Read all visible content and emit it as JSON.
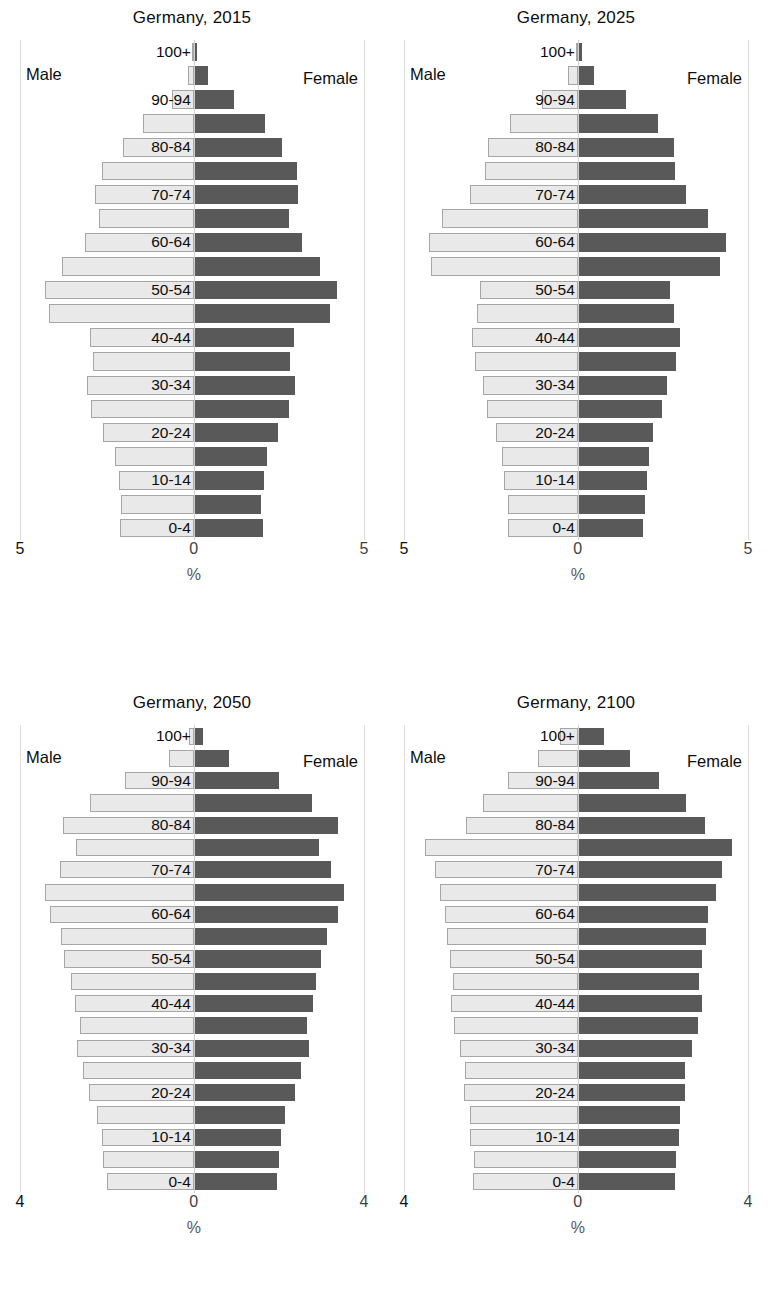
{
  "figure": {
    "axis_unit_label": "%",
    "male_legend": "Male",
    "female_legend": "Female",
    "colors": {
      "male_bar_fill": "#e9e9e9",
      "male_bar_border": "#a6a6a6",
      "female_bar_fill": "#595959",
      "gridline": "#dcdcdc",
      "text": "#0d0d0d"
    },
    "age_groups": [
      "0-4",
      "5-9",
      "10-14",
      "15-19",
      "20-24",
      "25-29",
      "30-34",
      "35-39",
      "40-44",
      "45-49",
      "50-54",
      "55-59",
      "60-64",
      "65-69",
      "70-74",
      "75-79",
      "80-84",
      "85-89",
      "90-94",
      "95-99",
      "100+"
    ],
    "visible_age_labels": [
      "0-4",
      "10-14",
      "20-24",
      "30-34",
      "40-44",
      "50-54",
      "60-64",
      "70-74",
      "80-84",
      "90-94",
      "100+"
    ]
  },
  "chart_data": [
    {
      "type": "bar",
      "subtype": "population-pyramid",
      "title": "Germany, 2015",
      "xlabel": "%",
      "ylabel": "",
      "xlim": [
        -5,
        5
      ],
      "xticks": [
        "5",
        "0",
        "5"
      ],
      "grid": false,
      "legend": [
        "Male",
        "Female"
      ],
      "legend_position": "inside-top-left / inside-top-right",
      "categories": [
        "0-4",
        "5-9",
        "10-14",
        "15-19",
        "20-24",
        "25-29",
        "30-34",
        "35-39",
        "40-44",
        "45-49",
        "50-54",
        "55-59",
        "60-64",
        "65-69",
        "70-74",
        "75-79",
        "80-84",
        "85-89",
        "90-94",
        "95-99",
        "100+"
      ],
      "series": [
        {
          "name": "Male",
          "values": [
            2.12,
            2.08,
            2.15,
            2.28,
            2.62,
            2.96,
            3.08,
            2.9,
            3.0,
            4.17,
            4.28,
            3.78,
            3.12,
            2.72,
            2.85,
            2.65,
            2.05,
            1.45,
            0.62,
            0.17,
            0.03
          ]
        },
        {
          "name": "Female",
          "values": [
            2.02,
            1.98,
            2.05,
            2.16,
            2.48,
            2.8,
            2.96,
            2.82,
            2.95,
            4.0,
            4.2,
            3.72,
            3.18,
            2.8,
            3.05,
            3.02,
            2.6,
            2.08,
            1.18,
            0.42,
            0.08
          ]
        }
      ]
    },
    {
      "type": "bar",
      "subtype": "population-pyramid",
      "title": "Germany, 2025",
      "xlabel": "%",
      "ylabel": "",
      "xlim": [
        -5,
        5
      ],
      "xticks": [
        "5",
        "0",
        "5"
      ],
      "grid": false,
      "legend": [
        "Male",
        "Female"
      ],
      "legend_position": "inside-top-left / inside-top-right",
      "categories": [
        "0-4",
        "5-9",
        "10-14",
        "15-19",
        "20-24",
        "25-29",
        "30-34",
        "35-39",
        "40-44",
        "45-49",
        "50-54",
        "55-59",
        "60-64",
        "65-69",
        "70-74",
        "75-79",
        "80-84",
        "85-89",
        "90-94",
        "95-99",
        "100+"
      ],
      "series": [
        {
          "name": "Male",
          "values": [
            2.0,
            2.02,
            2.12,
            2.18,
            2.35,
            2.6,
            2.72,
            2.95,
            3.05,
            2.9,
            2.8,
            4.22,
            4.28,
            3.9,
            3.1,
            2.68,
            2.58,
            1.95,
            1.02,
            0.28,
            0.06
          ]
        },
        {
          "name": "Female",
          "values": [
            1.92,
            1.96,
            2.02,
            2.08,
            2.22,
            2.48,
            2.62,
            2.88,
            3.0,
            2.82,
            2.72,
            4.18,
            4.35,
            3.82,
            3.18,
            2.85,
            2.82,
            2.35,
            1.42,
            0.48,
            0.12
          ]
        }
      ]
    },
    {
      "type": "bar",
      "subtype": "population-pyramid",
      "title": "Germany, 2050",
      "xlabel": "%",
      "ylabel": "",
      "xlim": [
        -4,
        4
      ],
      "xticks": [
        "4",
        "0",
        "4"
      ],
      "grid": false,
      "legend": [
        "Male",
        "Female"
      ],
      "legend_position": "inside-top-left / inside-top-right",
      "categories": [
        "0-4",
        "5-9",
        "10-14",
        "15-19",
        "20-24",
        "25-29",
        "30-34",
        "35-39",
        "40-44",
        "45-49",
        "50-54",
        "55-59",
        "60-64",
        "65-69",
        "70-74",
        "75-79",
        "80-84",
        "85-89",
        "90-94",
        "95-99",
        "100+"
      ],
      "series": [
        {
          "name": "Male",
          "values": [
            2.0,
            2.08,
            2.12,
            2.22,
            2.42,
            2.56,
            2.68,
            2.62,
            2.74,
            2.82,
            2.98,
            3.05,
            3.3,
            3.42,
            3.08,
            2.72,
            3.02,
            2.4,
            1.58,
            0.58,
            0.1
          ]
        },
        {
          "name": "Female",
          "values": [
            1.96,
            2.0,
            2.06,
            2.15,
            2.38,
            2.52,
            2.7,
            2.66,
            2.8,
            2.88,
            3.0,
            3.12,
            3.4,
            3.52,
            3.22,
            2.95,
            3.38,
            2.78,
            2.0,
            0.82,
            0.22
          ]
        }
      ]
    },
    {
      "type": "bar",
      "subtype": "population-pyramid",
      "title": "Germany, 2100",
      "xlabel": "%",
      "ylabel": "",
      "xlim": [
        -4,
        4
      ],
      "xticks": [
        "4",
        "0",
        "4"
      ],
      "grid": false,
      "legend": [
        "Male",
        "Female"
      ],
      "legend_position": "inside-top-left / inside-top-right",
      "categories": [
        "0-4",
        "5-9",
        "10-14",
        "15-19",
        "20-24",
        "25-29",
        "30-34",
        "35-39",
        "40-44",
        "45-49",
        "50-54",
        "55-59",
        "60-64",
        "65-69",
        "70-74",
        "75-79",
        "80-84",
        "85-89",
        "90-94",
        "95-99",
        "100+"
      ],
      "series": [
        {
          "name": "Male",
          "values": [
            2.42,
            2.38,
            2.48,
            2.48,
            2.62,
            2.6,
            2.72,
            2.85,
            2.92,
            2.88,
            2.95,
            3.0,
            3.05,
            3.18,
            3.28,
            3.52,
            2.58,
            2.18,
            1.6,
            0.92,
            0.42
          ]
        },
        {
          "name": "Female",
          "values": [
            2.28,
            2.3,
            2.38,
            2.4,
            2.52,
            2.52,
            2.68,
            2.82,
            2.92,
            2.85,
            2.92,
            3.02,
            3.05,
            3.25,
            3.38,
            3.62,
            2.98,
            2.55,
            1.92,
            1.22,
            0.62
          ]
        }
      ]
    }
  ]
}
